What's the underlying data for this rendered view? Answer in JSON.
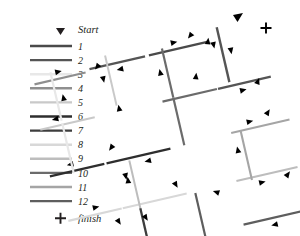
{
  "figure": {
    "title": "",
    "background": "#ffffff",
    "width": 300,
    "height": 236
  },
  "legend": {
    "name": "segment-legend",
    "start_label": "Start",
    "start_marker": "triangle-down-marker",
    "finish_label": "finish",
    "finish_marker": "plus-marker",
    "marker_color": "#231f20",
    "entries": [
      {
        "label": "1",
        "color": "#4a4a4a"
      },
      {
        "label": "2",
        "color": "#555555"
      },
      {
        "label": "3",
        "color": "#e8e8e8"
      },
      {
        "label": "4",
        "color": "#8f8f8f"
      },
      {
        "label": "5",
        "color": "#c9c9c9"
      },
      {
        "label": "6",
        "color": "#2e2e2e"
      },
      {
        "label": "7",
        "color": "#3d3d3d"
      },
      {
        "label": "8",
        "color": "#d8d8d8"
      },
      {
        "label": "9",
        "color": "#bdbdbd"
      },
      {
        "label": "10",
        "color": "#6b6b6b"
      },
      {
        "label": "11",
        "color": "#a5a5a5"
      },
      {
        "label": "12",
        "color": "#5e5e5e"
      }
    ]
  },
  "chart_data": {
    "type": "diagram",
    "title": "",
    "xlabel": "",
    "ylabel": "",
    "rotation_deg": -13,
    "start_marker": {
      "x": 238,
      "y": 16,
      "label": "Start"
    },
    "finish_marker": {
      "x": 266,
      "y": 28,
      "label": "finish"
    },
    "segments": [
      {
        "id": "1",
        "color": "#4a4a4a",
        "x1": 180,
        "y1": 34,
        "x2": 246,
        "y2": 19,
        "arrows": [
          {
            "t": 0.38,
            "dir": 1
          }
        ]
      },
      {
        "id": "2",
        "color": "#555555",
        "x1": 246,
        "y1": 19,
        "x2": 262,
        "y2": 88,
        "arrows": [
          {
            "t": 0.35,
            "dir": 1
          },
          {
            "t": 0.82,
            "dir": -1
          }
        ]
      },
      {
        "id": "3",
        "color": "#e8e8e8",
        "x1": 104,
        "y1": 58,
        "x2": 122,
        "y2": 131,
        "arrows": [
          {
            "t": 0.3,
            "dir": -1
          }
        ]
      },
      {
        "id": "4",
        "color": "#8f8f8f",
        "x1": 96,
        "y1": 78,
        "x2": 162,
        "y2": 62,
        "arrows": [
          {
            "t": 0.5,
            "dir": 1
          }
        ]
      },
      {
        "id": "5",
        "color": "#c9c9c9",
        "x1": 162,
        "y1": 62,
        "x2": 150,
        "y2": 46,
        "arrows": [
          {
            "t": 0.4,
            "dir": -1
          }
        ]
      },
      {
        "id": "6",
        "color": "#2e2e2e",
        "x1": 104,
        "y1": 124,
        "x2": 205,
        "y2": 99,
        "arrows": [
          {
            "t": 0.58,
            "dir": -1
          }
        ]
      },
      {
        "id": "7",
        "color": "#3d3d3d",
        "x1": 137,
        "y1": 173,
        "x2": 152,
        "y2": 230,
        "arrows": [
          {
            "t": 0.2,
            "dir": -1
          }
        ]
      },
      {
        "id": "8",
        "color": "#d8d8d8",
        "x1": 120,
        "y1": 165,
        "x2": 222,
        "y2": 141,
        "arrows": [
          {
            "t": 0.4,
            "dir": 1
          }
        ]
      },
      {
        "id": "9",
        "color": "#bdbdbd",
        "x1": 168,
        "y1": 116,
        "x2": 184,
        "y2": 186,
        "arrows": [
          {
            "t": 0.28,
            "dir": 1
          }
        ]
      },
      {
        "id": "10",
        "color": "#6b6b6b",
        "x1": 152,
        "y1": 205,
        "x2": 206,
        "y2": 192,
        "arrows": [
          {
            "t": 0.55,
            "dir": -1
          }
        ]
      },
      {
        "id": "11",
        "color": "#a5a5a5",
        "x1": 266,
        "y1": 110,
        "x2": 283,
        "y2": 181,
        "arrows": [
          {
            "t": 0.3,
            "dir": -1
          }
        ]
      },
      {
        "id": "12",
        "color": "#5e5e5e",
        "x1": 231,
        "y1": 180,
        "x2": 289,
        "y2": 166,
        "arrows": [
          {
            "t": 0.55,
            "dir": -1
          }
        ]
      }
    ],
    "arrow_color": "#000000",
    "legend_position": "left"
  }
}
